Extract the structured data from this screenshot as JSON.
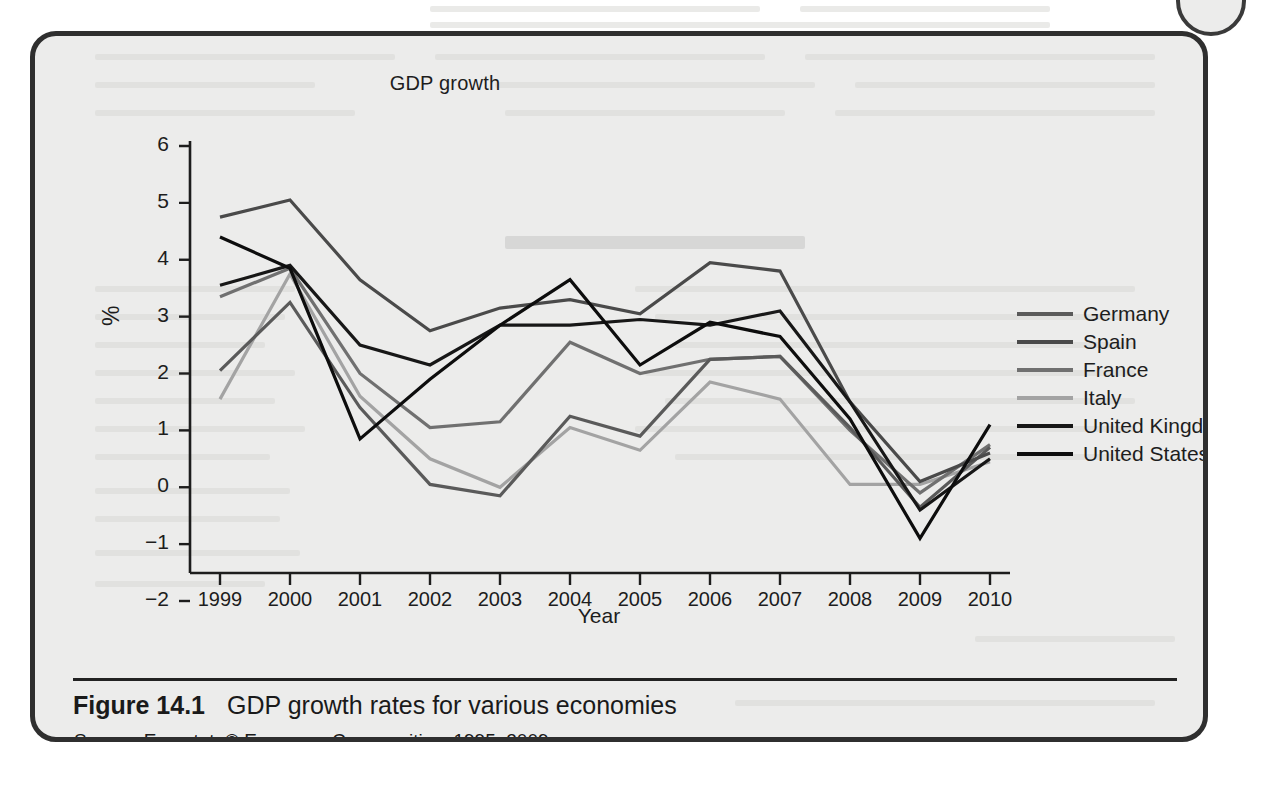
{
  "figure": {
    "number": "Figure 14.1",
    "caption": "GDP growth rates for various economies",
    "source_word": "Source",
    "source_text": ": Eurostat, © European Communities, 1995–2009."
  },
  "chart_data": {
    "type": "line",
    "title": "GDP growth",
    "xlabel": "Year",
    "ylabel": "%",
    "x": [
      1999,
      2000,
      2001,
      2002,
      2003,
      2004,
      2005,
      2006,
      2007,
      2008,
      2009,
      2010
    ],
    "xtick_labels": [
      "1999",
      "2000",
      "2001",
      "2002",
      "2003",
      "2004",
      "2005",
      "2006",
      "2007",
      "2008",
      "2009",
      "2010"
    ],
    "ytick_labels": [
      "6",
      "5",
      "4",
      "3",
      "2",
      "1",
      "0",
      "−1",
      "−2"
    ],
    "ylim": [
      -2,
      6
    ],
    "xlim": [
      1999,
      2010
    ],
    "grid": false,
    "legend_position": "right",
    "series": [
      {
        "name": "Germany",
        "color": "#5a5a5a",
        "values": [
          2.05,
          3.25,
          1.4,
          0.05,
          -0.15,
          1.25,
          0.9,
          2.25,
          2.3,
          1.05,
          -0.35,
          0.7
        ]
      },
      {
        "name": "Spain",
        "color": "#4a4a4a",
        "values": [
          4.75,
          5.05,
          3.65,
          2.75,
          3.15,
          3.3,
          3.05,
          3.95,
          3.8,
          1.5,
          0.1,
          0.6
        ]
      },
      {
        "name": "France",
        "color": "#707070",
        "values": [
          3.35,
          3.85,
          2.0,
          1.05,
          1.15,
          2.55,
          2.0,
          2.25,
          2.3,
          1.0,
          -0.1,
          0.75
        ]
      },
      {
        "name": "Italy",
        "color": "#a3a3a3",
        "values": [
          1.55,
          3.75,
          1.6,
          0.5,
          0.0,
          1.05,
          0.65,
          1.85,
          1.55,
          0.05,
          0.05,
          0.45
        ]
      },
      {
        "name": "United Kingdom",
        "color": "#171717",
        "values": [
          3.55,
          3.9,
          2.5,
          2.15,
          2.85,
          2.85,
          2.95,
          2.85,
          3.1,
          1.5,
          -0.4,
          0.5
        ]
      },
      {
        "name": "United States",
        "color": "#0d0d0d",
        "values": [
          4.4,
          3.85,
          0.85,
          1.9,
          2.85,
          3.65,
          2.15,
          2.9,
          2.65,
          1.2,
          -0.9,
          1.1
        ]
      }
    ]
  },
  "legend": {
    "items": [
      {
        "label": "Germany",
        "color": "#5a5a5a"
      },
      {
        "label": "Spain",
        "color": "#4a4a4a"
      },
      {
        "label": "France",
        "color": "#707070"
      },
      {
        "label": "Italy",
        "color": "#a3a3a3"
      },
      {
        "label": "United Kingdom",
        "color": "#171717"
      },
      {
        "label": "United States",
        "color": "#0d0d0d"
      }
    ]
  }
}
